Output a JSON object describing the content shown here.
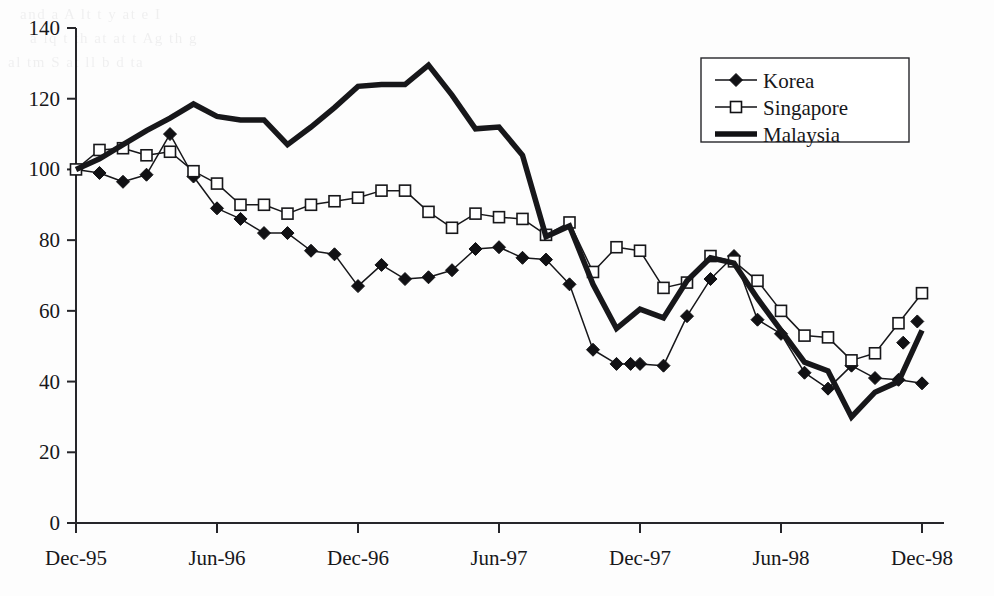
{
  "chart_data": {
    "type": "line",
    "title": "",
    "subtitle": "",
    "xlabel": "",
    "ylabel": "",
    "ylim": [
      0,
      140
    ],
    "ytick_step": 20,
    "ytick_labels": [
      "0",
      "20",
      "40",
      "60",
      "80",
      "100",
      "120",
      "140"
    ],
    "xtick_labels": [
      "Dec-95",
      "Jun-96",
      "Dec-96",
      "Jun-97",
      "Dec-97",
      "Jun-98",
      "Dec-98"
    ],
    "xtick_months": [
      0,
      6,
      12,
      18,
      24,
      30,
      36
    ],
    "grid": false,
    "legend_position": "top-right",
    "x": [
      "Dec-95",
      "Jan-96",
      "Feb-96",
      "Mar-96",
      "Apr-96",
      "May-96",
      "Jun-96",
      "Jul-96",
      "Aug-96",
      "Sep-96",
      "Oct-96",
      "Nov-96",
      "Dec-96",
      "Jan-97",
      "Feb-97",
      "Mar-97",
      "Apr-97",
      "May-97",
      "Jun-97",
      "Jul-97",
      "Aug-97",
      "Sep-97",
      "Oct-97",
      "Nov-97",
      "Dec-97",
      "Jan-98",
      "Feb-98",
      "Mar-98",
      "Apr-98",
      "May-98",
      "Jun-98",
      "Jul-98",
      "Aug-98",
      "Sep-98",
      "Oct-98",
      "Nov-98",
      "Dec-98"
    ],
    "series": [
      {
        "name": "Korea",
        "marker": "filled-diamond",
        "values": [
          100.0,
          99.0,
          96.5,
          98.5,
          110.0,
          98.0,
          89.0,
          86.0,
          82.0,
          82.0,
          77.0,
          76.0,
          67.0,
          73.0,
          69.0,
          69.5,
          71.5,
          77.5,
          78.0,
          75.0,
          74.5,
          67.5,
          49.0,
          45.0,
          45.0,
          44.5,
          58.5,
          69.0,
          75.5,
          57.5,
          53.5,
          42.5,
          38.0,
          44.5,
          41.0,
          40.5,
          39.5
        ]
      },
      {
        "name": "Singapore",
        "marker": "open-square",
        "values": [
          100.0,
          105.5,
          106.0,
          104.0,
          105.0,
          99.5,
          96.0,
          90.0,
          90.0,
          87.5,
          90.0,
          91.0,
          92.0,
          94.0,
          94.0,
          88.0,
          83.5,
          87.5,
          86.5,
          86.0,
          81.5,
          85.0,
          71.0,
          78.0,
          77.0,
          66.5,
          68.0,
          75.5,
          74.0,
          68.5,
          60.0,
          53.0,
          52.5,
          46.0,
          48.0,
          56.5,
          65.0
        ]
      },
      {
        "name": "Malaysia",
        "marker": "thick-line",
        "values": [
          100.0,
          103.0,
          107.0,
          111.0,
          114.5,
          118.5,
          115.0,
          114.0,
          114.0,
          107.0,
          112.0,
          117.5,
          123.5,
          124.0,
          124.0,
          129.5,
          121.0,
          111.5,
          112.0,
          104.0,
          81.0,
          84.0,
          67.5,
          55.0,
          60.5,
          58.0,
          68.5,
          75.0,
          73.5,
          63.5,
          54.5,
          45.5,
          43.0,
          30.0,
          37.0,
          40.0,
          54.5
        ]
      }
    ],
    "korea_extra_points": [
      {
        "month_index": 23.6,
        "value": 45.0
      },
      {
        "month_index": 35.2,
        "value": 51.0
      },
      {
        "month_index": 35.8,
        "value": 57.0
      }
    ]
  },
  "legend": {
    "items": [
      {
        "label": "Korea",
        "marker": "filled-diamond",
        "color": "#111114"
      },
      {
        "label": "Singapore",
        "marker": "open-square",
        "color": "#111114"
      },
      {
        "label": "Malaysia",
        "marker": "thick-line",
        "color": "#111114"
      }
    ]
  },
  "colors": {
    "line": "#17171a",
    "axis": "#26262a",
    "background": "#fdfdfd",
    "marker_fill": "#111114",
    "marker_open": "#ffffff"
  },
  "background_artifacts": [
    "and    a     A  lt      t  y  at          e    I",
    "a       lq    t  th   at   at    t  Ag    th   g",
    "al  tm    S    at  ll   b   d     ta"
  ]
}
